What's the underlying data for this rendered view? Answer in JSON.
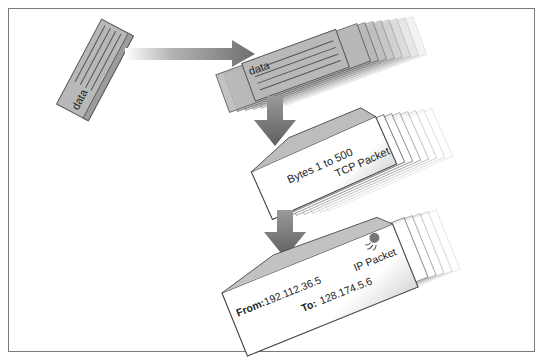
{
  "diagram": {
    "type": "packet-encapsulation",
    "source_block": {
      "label": "data"
    },
    "data_stack": {
      "label": "data"
    },
    "tcp_packet": {
      "content": "Bytes 1 to 500",
      "label": "TCP Packet"
    },
    "ip_packet": {
      "from_label": "From:",
      "from_value": "192.112.36.5",
      "to_label": "To:",
      "to_value": "128.174.5.6",
      "label": "IP Packet",
      "stamp_icon": "postage-stamp-icon"
    },
    "arrows": [
      {
        "name": "split-arrow",
        "direction": "right"
      },
      {
        "name": "wrap-tcp-arrow",
        "direction": "down"
      },
      {
        "name": "wrap-ip-arrow",
        "direction": "down"
      }
    ],
    "colors": {
      "block_fill": "#b8b8b8",
      "block_stroke": "#555555",
      "arrow_fill": "#7a7a7a",
      "envelope_fill": "#ffffff",
      "frame_border": "#7a7a7a"
    }
  }
}
